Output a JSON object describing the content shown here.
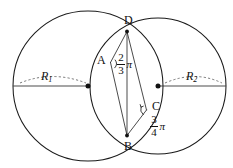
{
  "figure": {
    "background_color": "#ffffff",
    "line_color": "#1a1a1a",
    "dashed_color": "#555555"
  },
  "labels": {
    "point_a": "A",
    "point_b": "B",
    "point_c": "C",
    "point_d": "D",
    "radius_1": "R",
    "radius_1_sub": "1",
    "radius_2": "R",
    "radius_2_sub": "2"
  },
  "angles": {
    "at_a": {
      "numerator": "2",
      "denominator": "3",
      "unit": "π",
      "value_text": "2/3 π",
      "vertex": "A"
    },
    "at_c": {
      "numerator": "3",
      "denominator": "4",
      "unit": "π",
      "value_text": "3/4 π",
      "vertex": "C"
    }
  },
  "geometry": {
    "circle_1": {
      "cx": 88,
      "cy": 86,
      "r": 75,
      "label": "R1"
    },
    "circle_2": {
      "cx": 158,
      "cy": 86,
      "r": 68,
      "label": "R2"
    },
    "intersection_top": {
      "x": 127,
      "y": 31,
      "label": "D"
    },
    "intersection_bottom": {
      "x": 127,
      "y": 136,
      "label": "B"
    },
    "point_a": {
      "x": 112,
      "y": 62,
      "label": "A"
    },
    "point_c": {
      "x": 146,
      "y": 110,
      "label": "C"
    }
  }
}
